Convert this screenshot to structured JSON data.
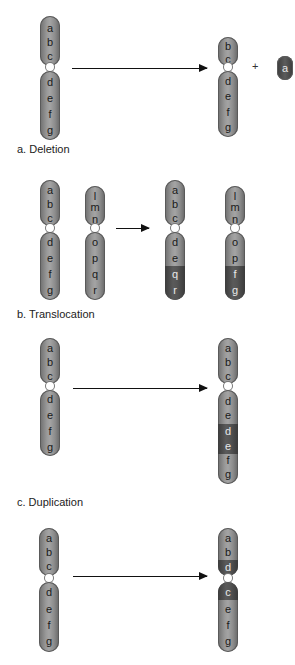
{
  "colors": {
    "chromosome": "#8c8c8c",
    "highlight": "#505050",
    "background": "#ffffff"
  },
  "panels": {
    "deletion": {
      "label": "a. Deletion",
      "before": {
        "p_arm": [
          "a",
          "b",
          "c"
        ],
        "q_arm": [
          "d",
          "e",
          "f",
          "g"
        ]
      },
      "after": {
        "p_arm": [
          "b",
          "c"
        ],
        "q_arm": [
          "d",
          "e",
          "f",
          "g"
        ]
      },
      "plus": "+",
      "fragment": "a"
    },
    "translocation": {
      "label": "b. Translocation",
      "before_1": {
        "p_arm": [
          "a",
          "b",
          "c"
        ],
        "q_arm": [
          "d",
          "e",
          "f",
          "g"
        ]
      },
      "before_2": {
        "p_arm": [
          "l",
          "m",
          "n"
        ],
        "q_arm": [
          "o",
          "p",
          "q",
          "r"
        ]
      },
      "after_1": {
        "p_arm": [
          "a",
          "b",
          "c"
        ],
        "q_arm": [
          "d",
          "e",
          "q",
          "r"
        ],
        "dark": [
          "q",
          "r"
        ]
      },
      "after_2": {
        "p_arm": [
          "l",
          "m",
          "n"
        ],
        "q_arm": [
          "o",
          "p",
          "f",
          "g"
        ],
        "dark": [
          "f",
          "g"
        ]
      }
    },
    "duplication": {
      "label": "c. Duplication",
      "before": {
        "p_arm": [
          "a",
          "b",
          "c"
        ],
        "q_arm": [
          "d",
          "e",
          "f",
          "g"
        ]
      },
      "after": {
        "p_arm": [
          "a",
          "b",
          "c"
        ],
        "q_arm": [
          "d",
          "e",
          "d",
          "e",
          "f",
          "g"
        ],
        "dark_indices": [
          2,
          3
        ]
      }
    },
    "inversion": {
      "before": {
        "p_arm": [
          "a",
          "b",
          "c"
        ],
        "q_arm": [
          "d",
          "e",
          "f",
          "g"
        ]
      },
      "after": {
        "p_arm": [
          "a",
          "b",
          "d"
        ],
        "q_arm": [
          "c",
          "e",
          "f",
          "g"
        ],
        "dark": [
          "d",
          "c"
        ]
      }
    }
  }
}
